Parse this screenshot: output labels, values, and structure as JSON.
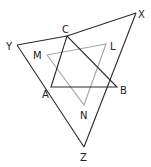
{
  "diagram": {
    "type": "geometry",
    "colors": {
      "primary": "#2a2a2a",
      "secondary": "#a8a8a8",
      "label": "#222222"
    },
    "points": {
      "X": {
        "x": 136,
        "y": 13,
        "label": "X",
        "lx": 138,
        "ly": 18
      },
      "Y": {
        "x": 17,
        "y": 45,
        "label": "Y",
        "lx": 6,
        "ly": 50
      },
      "C": {
        "x": 67,
        "y": 36,
        "label": "C",
        "lx": 62,
        "ly": 33
      },
      "A": {
        "x": 51,
        "y": 87,
        "label": "A",
        "lx": 42,
        "ly": 98
      },
      "B": {
        "x": 117,
        "y": 87,
        "label": "B",
        "lx": 120,
        "ly": 94
      },
      "Z": {
        "x": 84,
        "y": 147,
        "label": "Z",
        "lx": 80,
        "ly": 161
      },
      "M": {
        "x": 47,
        "y": 55,
        "label": "M",
        "lx": 33,
        "ly": 59
      },
      "L": {
        "x": 106,
        "y": 44,
        "label": "L",
        "lx": 110,
        "ly": 50
      },
      "N": {
        "x": 84,
        "y": 105,
        "label": "N",
        "lx": 80,
        "ly": 119
      }
    },
    "triangles": [
      {
        "name": "XYZ",
        "note": "outer triangle XY passes through C, YZ through A, XZ through B"
      },
      {
        "name": "ABC"
      },
      {
        "name": "LMN",
        "color": "gray"
      }
    ],
    "labels": [
      "X",
      "Y",
      "C",
      "M",
      "L",
      "A",
      "B",
      "N",
      "Z"
    ]
  }
}
